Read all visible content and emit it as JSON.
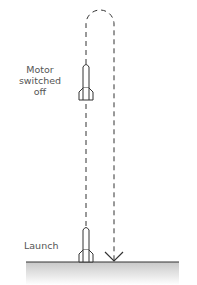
{
  "diagram": {
    "type": "rocket-flight-path",
    "labels": {
      "motor_line1": "Motor",
      "motor_line2": "switched",
      "motor_line3": "off",
      "launch": "Launch"
    },
    "colors": {
      "stroke": "#333333",
      "text": "#555555",
      "ground_shade": "#cfcfcf"
    }
  }
}
